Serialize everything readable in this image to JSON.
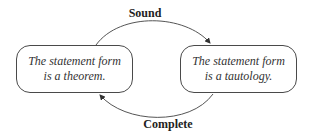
{
  "diagram": {
    "left_node": {
      "line1": "The statement form",
      "line2": "is a theorem."
    },
    "right_node": {
      "line1": "The statement form",
      "line2": "is a tautology."
    },
    "top_edge": {
      "label": "Sound",
      "direction": "left-to-right"
    },
    "bottom_edge": {
      "label": "Complete",
      "direction": "right-to-left"
    },
    "colors": {
      "stroke": "#4a4a4a",
      "text": "#333333",
      "background": "#ffffff"
    }
  }
}
